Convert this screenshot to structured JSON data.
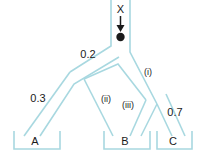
{
  "diagram": {
    "title_symbol": "X",
    "colors": {
      "channel": "#a8d8e0",
      "ink": "#1a1a1a",
      "background": "#ffffff"
    },
    "input": {
      "label": "X",
      "arrow_icon": "down-arrow-icon",
      "node_icon": "filled-circle-node"
    },
    "edge_labels": [
      {
        "id": "p-left",
        "text": "0.2"
      },
      {
        "id": "p-a",
        "text": "0.3"
      },
      {
        "id": "p-c",
        "text": "0.7"
      }
    ],
    "path_labels": [
      {
        "id": "path-i",
        "text": "(i)"
      },
      {
        "id": "path-ii",
        "text": "(ii)"
      },
      {
        "id": "path-iii",
        "text": "(iii)"
      }
    ],
    "bins": [
      {
        "id": "bin-a",
        "label": "A"
      },
      {
        "id": "bin-b",
        "label": "B"
      },
      {
        "id": "bin-c",
        "label": "C"
      }
    ]
  }
}
